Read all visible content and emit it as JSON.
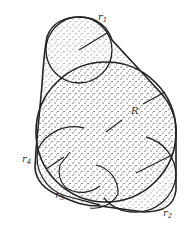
{
  "diagram": {
    "labels": {
      "R": "R",
      "r1": {
        "base": "r",
        "sub": "1"
      },
      "r2": {
        "base": "r",
        "sub": "2"
      },
      "r3": {
        "base": "r",
        "sub": "3"
      },
      "r4": {
        "base": "r",
        "sub": "4"
      }
    },
    "colors": {
      "stroke": "#222222",
      "stipple": "#555555",
      "background": "#ffffff"
    }
  }
}
